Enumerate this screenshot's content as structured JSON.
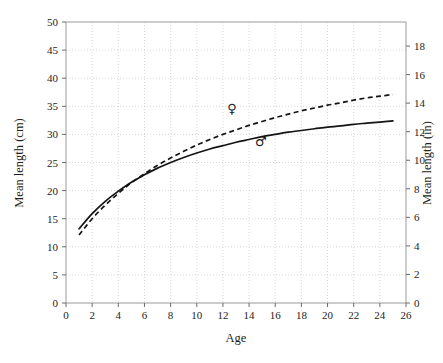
{
  "chart_data": {
    "type": "line",
    "title": "",
    "xlabel": "Age",
    "ylabel": "Mean length (cm)",
    "ylabel_right": "Mean length (in)",
    "xlim": [
      0,
      26
    ],
    "ylim": [
      0,
      50
    ],
    "ylim_right": [
      0,
      19.685
    ],
    "xticks": [
      0,
      2,
      4,
      6,
      8,
      10,
      12,
      14,
      16,
      18,
      20,
      22,
      24,
      26
    ],
    "xtick_labels": [
      "0",
      "2",
      "4",
      "6",
      "8",
      "10",
      "12",
      "14",
      "16",
      "18",
      "20",
      "22",
      "24",
      "26"
    ],
    "yticks": [
      0,
      5,
      10,
      15,
      20,
      25,
      30,
      35,
      40,
      45,
      50
    ],
    "ytick_labels": [
      "0",
      "5",
      "10",
      "15",
      "20",
      "25",
      "30",
      "35",
      "40",
      "45",
      "50"
    ],
    "yticks_right": [
      0,
      2,
      4,
      6,
      8,
      10,
      12,
      14,
      16,
      18
    ],
    "ytick_labels_right": [
      "0",
      "2",
      "4",
      "6",
      "8",
      "10",
      "12",
      "14",
      "16",
      "18"
    ],
    "grid": true,
    "legend_position": "inline-glyphs",
    "x": [
      1,
      2,
      3,
      4,
      5,
      6,
      7,
      8,
      9,
      10,
      11,
      12,
      13,
      14,
      15,
      16,
      17,
      18,
      19,
      20,
      21,
      22,
      23,
      24,
      25
    ],
    "series": [
      {
        "name": "male",
        "symbol": "♂",
        "style": "solid",
        "values": [
          13.2,
          15.9,
          18.1,
          19.9,
          21.5,
          22.8,
          24.0,
          25.0,
          25.9,
          26.7,
          27.4,
          28.0,
          28.6,
          29.1,
          29.6,
          30.0,
          30.4,
          30.7,
          31.0,
          31.3,
          31.5,
          31.8,
          32.0,
          32.2,
          32.4
        ],
        "label_x": 14.9,
        "label_y": 28.0
      },
      {
        "name": "female",
        "symbol": "♀",
        "style": "dashed",
        "values": [
          12.1,
          15.0,
          17.4,
          19.5,
          21.4,
          23.0,
          24.5,
          25.8,
          27.0,
          28.1,
          29.1,
          30.0,
          30.8,
          31.6,
          32.3,
          33.0,
          33.6,
          34.2,
          34.7,
          35.2,
          35.6,
          36.1,
          36.5,
          36.8,
          37.1
        ],
        "label_x": 12.7,
        "label_y": 33.8
      }
    ]
  },
  "axes": {
    "left_title": "Mean length (cm)",
    "right_title": "Mean length (in)",
    "bottom_title": "Age"
  }
}
